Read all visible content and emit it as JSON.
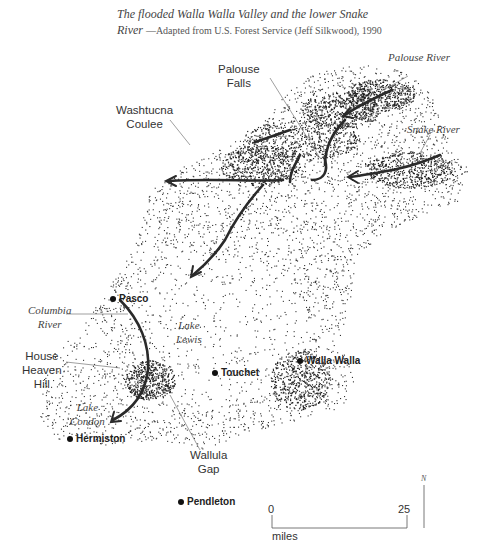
{
  "caption": {
    "title": "The flooded Walla Walla Valley and the lower Snake River",
    "title_line1": "The flooded Walla Walla Valley and the lower Snake",
    "title_line2": "River",
    "source": "—Adapted from U.S. Forest Service (Jeff Silkwood), 1990"
  },
  "labels": {
    "palouse_falls": [
      "Palouse",
      "Falls"
    ],
    "washtucna_coulee": [
      "Washtucna",
      "Coulee"
    ],
    "palouse_river": "Palouse River",
    "snake_river": "Snake River",
    "columbia_river": [
      "Columbia",
      "River"
    ],
    "house_heaven_hill": [
      "House",
      "Heaven",
      "Hill"
    ],
    "lake_lewis": [
      "Lake",
      "Lewis"
    ],
    "lake_condon": [
      "Lake",
      "Condon"
    ],
    "wallula_gap": [
      "Wallula",
      "Gap"
    ]
  },
  "cities": {
    "pasco": "Pasco",
    "touchet": "Touchet",
    "walla_walla": "Walla Walla",
    "hermiston": "Hermiston",
    "pendleton": "Pendleton"
  },
  "scale": {
    "min": "0",
    "max": "25",
    "unit": "miles"
  },
  "north_label": "N",
  "colors": {
    "ink": "#222222",
    "background": "#ffffff"
  }
}
